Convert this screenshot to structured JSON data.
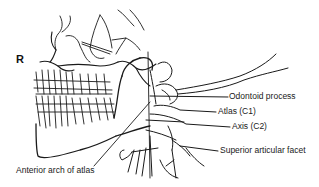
{
  "diagram": {
    "type": "anatomical-line-drawing",
    "side_marker": "R",
    "labels": [
      {
        "id": "odontoid",
        "text": "Odontoid process"
      },
      {
        "id": "atlas",
        "text": "Atlas (C1)"
      },
      {
        "id": "axis",
        "text": "Axis (C2)"
      },
      {
        "id": "facet",
        "text": "Superior articular facet"
      },
      {
        "id": "anterior_arch",
        "text": "Anterior arch of atlas"
      }
    ],
    "colors": {
      "line": "#1a1a1a",
      "background": "#ffffff"
    }
  }
}
